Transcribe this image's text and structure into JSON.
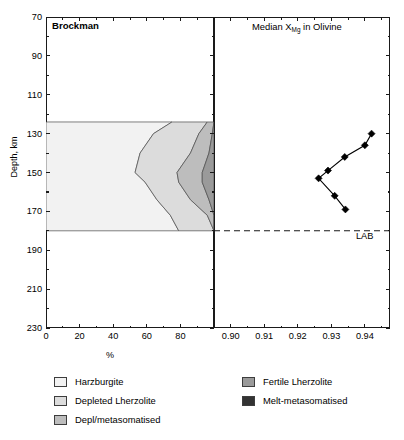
{
  "figure": {
    "left_panel": {
      "title": "Brockman"
    },
    "right_panel": {
      "title_prefix": "Median X",
      "title_sub": "Mg",
      "title_suffix": " in Olivine"
    },
    "lab_label": "LAB"
  },
  "axes": {
    "y": {
      "label": "Depth, km",
      "min": 70,
      "max": 230,
      "inverted": true,
      "ticks": [
        70,
        90,
        110,
        130,
        150,
        170,
        190,
        210,
        230
      ],
      "minor_ticks": [
        80,
        100,
        120,
        140,
        160,
        180,
        200,
        220
      ],
      "tick_labels": [
        "70",
        "90",
        "110",
        "130",
        "150",
        "170",
        "190",
        "210",
        "230"
      ]
    },
    "x_left": {
      "label": "%",
      "min": 0,
      "max": 100,
      "ticks": [
        0,
        20,
        40,
        60,
        80
      ],
      "minor_ticks": [
        10,
        30,
        50,
        70,
        90
      ],
      "tick_labels": [
        "0",
        "20",
        "40",
        "60",
        "80"
      ]
    },
    "x_right": {
      "label": "",
      "min": 0.895,
      "max": 0.9475,
      "ticks": [
        0.9,
        0.91,
        0.92,
        0.93,
        0.94
      ],
      "minor_ticks": [
        0.905,
        0.915,
        0.925,
        0.935,
        0.945
      ],
      "tick_labels": [
        "0.90",
        "0.91",
        "0.92",
        "0.93",
        "0.94"
      ]
    }
  },
  "colors": {
    "harzburgite": "#f2f2f2",
    "depleted_lherzolite": "#dcdcdc",
    "depl_metasomatised": "#bdbdbd",
    "fertile_lherzolite": "#9a9a9a",
    "melt_metasomatised": "#333333",
    "outline": "#4a4a4a",
    "axis": "#1a1a1a",
    "marker": "#000000"
  },
  "legend": {
    "column_1": [
      {
        "label": "Harzburgite",
        "color": "#f2f2f2"
      },
      {
        "label": "Depleted Lherzolite",
        "color": "#dcdcdc"
      },
      {
        "label": "Depl/metasomatised",
        "color": "#bdbdbd"
      }
    ],
    "column_2": [
      {
        "label": "Fertile Lherzolite",
        "color": "#9a9a9a"
      },
      {
        "label": "Melt-metasomatised",
        "color": "#333333"
      }
    ]
  },
  "chart_data": [
    {
      "type": "area",
      "title": "Brockman",
      "xlabel": "%",
      "ylabel": "Depth, km",
      "xlim": [
        0,
        100
      ],
      "ylim": [
        70,
        230
      ],
      "y_inverted": true,
      "grid": false,
      "legend_position": "below",
      "note": "100% stacked area of rock-type proportions vs depth; shaded only between 124 km and 180 km (LAB).",
      "depths": [
        124,
        130,
        140,
        150,
        155,
        164,
        172,
        180
      ],
      "series": [
        {
          "name": "Harzburgite",
          "values": [
            75,
            64,
            56,
            53,
            59,
            66,
            74,
            79
          ]
        },
        {
          "name": "Depleted Lherzolite",
          "values": [
            21,
            27,
            30,
            25,
            20,
            20,
            22,
            21
          ]
        },
        {
          "name": "Depl/metasomatised",
          "values": [
            4,
            8,
            11,
            15,
            14,
            11,
            4,
            0
          ]
        },
        {
          "name": "Fertile Lherzolite",
          "values": [
            0,
            1,
            3,
            7,
            7,
            3,
            0,
            0
          ]
        },
        {
          "name": "Melt-metasomatised",
          "values": [
            0,
            0,
            0,
            0,
            0,
            0,
            0,
            0
          ]
        }
      ]
    },
    {
      "type": "line",
      "title": "Median XMg in Olivine",
      "xlabel": "",
      "ylabel": "Depth, km",
      "xlim": [
        0.895,
        0.9475
      ],
      "ylim": [
        70,
        230
      ],
      "y_inverted": true,
      "grid": false,
      "marker": "diamond",
      "annotations": [
        {
          "text": "LAB",
          "depth": 180,
          "style": "dashed-horizontal-line"
        }
      ],
      "points": [
        {
          "x": 0.942,
          "y": 130
        },
        {
          "x": 0.94,
          "y": 136
        },
        {
          "x": 0.934,
          "y": 142
        },
        {
          "x": 0.929,
          "y": 149
        },
        {
          "x": 0.9262,
          "y": 153
        },
        {
          "x": 0.931,
          "y": 162
        },
        {
          "x": 0.9342,
          "y": 169
        }
      ]
    }
  ]
}
